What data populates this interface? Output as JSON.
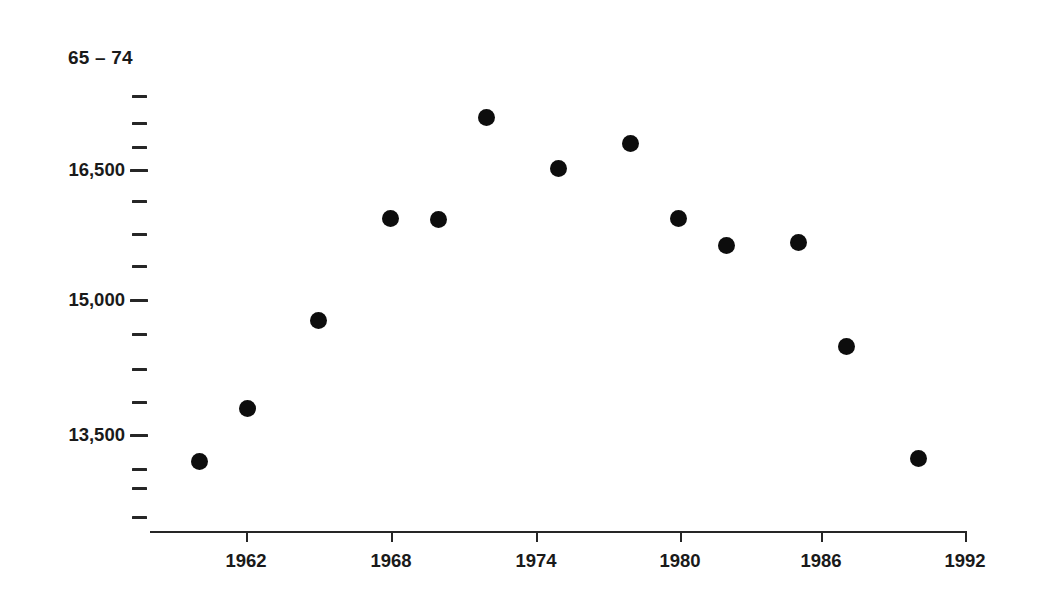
{
  "chart_data": {
    "type": "scatter",
    "title": "65 – 74",
    "xlabel": "",
    "ylabel": "",
    "grid": false,
    "legend": null,
    "marker": {
      "shape": "circle",
      "color": "#0d0d0d",
      "size_px": 17
    },
    "xlim": [
      1959,
      1992.6
    ],
    "ylim": [
      12800,
      17900
    ],
    "x_ticks": [
      1962,
      1968,
      1974,
      1980,
      1986,
      1992
    ],
    "x_tick_labels": [
      "1962",
      "1968",
      "1974",
      "1980",
      "1986",
      "1992"
    ],
    "y_ticks_labeled": [
      16500,
      15000,
      13500
    ],
    "y_tick_labels": [
      "16,500",
      "15,000",
      "13,500"
    ],
    "y_ticks_minor": [
      17700,
      17325,
      16950,
      16125,
      15750,
      15375,
      14625,
      14250,
      13875,
      13125,
      12750,
      12570
    ],
    "x": [
      1960,
      1962,
      1965,
      1968,
      1970,
      1972,
      1975,
      1978,
      1980,
      1982,
      1985,
      1987,
      1990
    ],
    "y": [
      13200,
      13800,
      14800,
      15950,
      15940,
      17100,
      16520,
      16800,
      15950,
      15650,
      15680,
      14500,
      13230
    ],
    "points": [
      {
        "year": 1960,
        "value": 13200
      },
      {
        "year": 1962,
        "value": 13800
      },
      {
        "year": 1965,
        "value": 14800
      },
      {
        "year": 1968,
        "value": 15950
      },
      {
        "year": 1970,
        "value": 15940
      },
      {
        "year": 1972,
        "value": 17100
      },
      {
        "year": 1975,
        "value": 16520
      },
      {
        "year": 1978,
        "value": 16800
      },
      {
        "year": 1980,
        "value": 15950
      },
      {
        "year": 1982,
        "value": 15650
      },
      {
        "year": 1985,
        "value": 15680
      },
      {
        "year": 1987,
        "value": 14500
      },
      {
        "year": 1990,
        "value": 13230
      }
    ]
  },
  "axes": {
    "y_label_16500": "16,500",
    "y_label_15000": "15,000",
    "y_label_13500": "13,500",
    "x_label_1962": "1962",
    "x_label_1968": "1968",
    "x_label_1974": "1974",
    "x_label_1980": "1980",
    "x_label_1986": "1986",
    "x_label_1992": "1992"
  },
  "header": {
    "title": "65 – 74"
  },
  "colors": {
    "marker": "#0d0d0d",
    "axis": "#262626",
    "text": "#1a1a1a",
    "background": "#ffffff"
  }
}
